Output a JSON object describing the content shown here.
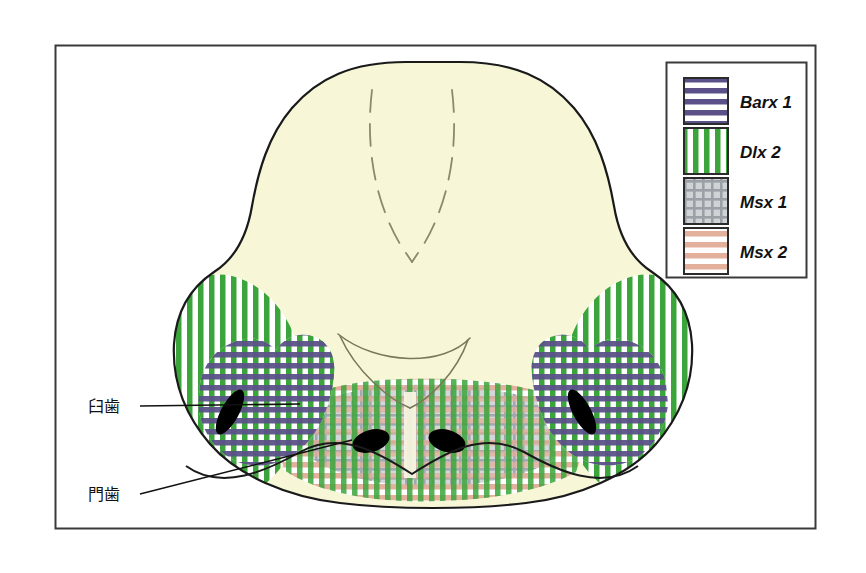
{
  "figure": {
    "title": "",
    "frame": {
      "x": 55,
      "y": 45,
      "width": 760,
      "height": 483,
      "border_color": "#3a3a3a"
    },
    "background_color": "#ffffff",
    "field_fill": "#f7f7d8",
    "outline_color": "#1a1a1a"
  },
  "legend": {
    "box": {
      "x": 666,
      "y": 62,
      "width": 140,
      "height": 215
    },
    "border_color": "#3a3a3a",
    "items": [
      {
        "label": "Barx 1",
        "gene": "Barx1",
        "pattern": "horizontal-stripes",
        "color": "#5b5188",
        "swatch_bg": "#ffffff"
      },
      {
        "label": "Dlx 2",
        "gene": "Dlx2",
        "pattern": "vertical-stripes",
        "color": "#3ba53b",
        "swatch_bg": "#ffffff"
      },
      {
        "label": "Msx 1",
        "gene": "Msx1",
        "pattern": "grid-crosshatch",
        "color": "#9aa0a6",
        "swatch_bg": "#c9cdd1"
      },
      {
        "label": "Msx 2",
        "gene": "Msx2",
        "pattern": "horizontal-stripes",
        "color": "#e3b09c",
        "swatch_bg": "#ffffff"
      }
    ]
  },
  "annotations": [
    {
      "name": "molar-label",
      "text": "臼歯",
      "x": 90,
      "y": 412,
      "leader_to_x": 300,
      "leader_to_y": 404
    },
    {
      "name": "incisor-label",
      "text": "門歯",
      "x": 90,
      "y": 500,
      "leader_to_x": 352,
      "leader_to_y": 440
    }
  ],
  "structures": {
    "teeth_primordia": [
      {
        "name": "molar-left",
        "cx": 230,
        "cy": 412,
        "rx": 9,
        "ry": 25,
        "rotate": 28,
        "fill": "#000000"
      },
      {
        "name": "molar-right",
        "cx": 582,
        "cy": 412,
        "rx": 9,
        "ry": 25,
        "rotate": -28,
        "fill": "#000000"
      },
      {
        "name": "incisor-left",
        "cx": 371,
        "cy": 441,
        "rx": 19,
        "ry": 11,
        "rotate": -17,
        "fill": "#000000"
      },
      {
        "name": "incisor-right",
        "cx": 447,
        "cy": 441,
        "rx": 19,
        "ry": 11,
        "rotate": 17,
        "fill": "#000000"
      }
    ],
    "midline_dashed": {
      "name": "nasal-midline-dashed",
      "color": "#8a8a6a"
    },
    "palatal_arch": {
      "name": "palatal-arch-line",
      "color": "#7a7a5a"
    }
  }
}
